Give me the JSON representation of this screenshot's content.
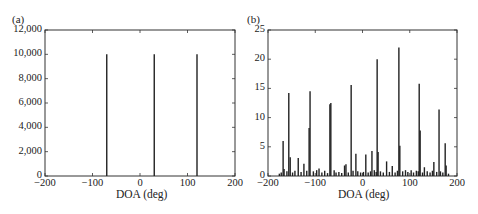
{
  "chart_data": [
    {
      "panel": "(a)",
      "type": "bar",
      "title": "",
      "xlabel": "DOA (deg)",
      "ylabel": "",
      "xlim": [
        -200,
        200
      ],
      "ylim": [
        0,
        12000
      ],
      "xticks": [
        -200,
        -100,
        0,
        100,
        200
      ],
      "xtick_labels": [
        "−200",
        "−100",
        "0",
        "100",
        "200"
      ],
      "yticks": [
        0,
        2000,
        4000,
        6000,
        8000,
        10000,
        12000
      ],
      "ytick_labels": [
        "0",
        "2,000",
        "4,000",
        "6,000",
        "8,000",
        "10,000",
        "12,000"
      ],
      "grid": false,
      "x": [
        -70,
        30,
        120
      ],
      "values": [
        10000,
        10000,
        10000
      ]
    },
    {
      "panel": "(b)",
      "type": "bar",
      "title": "",
      "xlabel": "DOA (deg)",
      "ylabel": "",
      "xlim": [
        -200,
        200
      ],
      "ylim": [
        0,
        25
      ],
      "xticks": [
        -200,
        -100,
        0,
        100,
        200
      ],
      "xtick_labels": [
        "−200",
        "−100",
        "0",
        "100",
        "200"
      ],
      "yticks": [
        0,
        5,
        10,
        15,
        20,
        25
      ],
      "ytick_labels": [
        "0",
        "5",
        "10",
        "15",
        "20",
        "25"
      ],
      "grid": false,
      "x": [
        -176,
        -172,
        -168,
        -166,
        -160,
        -156,
        -153,
        -148,
        -143,
        -136,
        -130,
        -124,
        -118,
        -113,
        -111,
        -104,
        -97,
        -92,
        -86,
        -80,
        -74,
        -69,
        -67,
        -60,
        -56,
        -50,
        -44,
        -38,
        -35,
        -30,
        -24,
        -20,
        -14,
        -10,
        -4,
        2,
        7,
        12,
        17,
        20,
        25,
        29,
        31,
        33,
        38,
        44,
        51,
        57,
        63,
        69,
        74,
        77,
        79,
        85,
        91,
        96,
        103,
        108,
        114,
        118,
        120,
        122,
        127,
        131,
        137,
        143,
        148,
        151,
        157,
        162,
        165,
        170,
        175,
        177,
        182
      ],
      "values": [
        0.4,
        0.6,
        6.0,
        1.2,
        0.8,
        14.2,
        3.2,
        0.6,
        0.9,
        3.1,
        0.7,
        2.1,
        0.9,
        8.2,
        14.5,
        0.8,
        1.0,
        1.3,
        0.6,
        0.9,
        0.5,
        12.3,
        12.5,
        1.0,
        0.6,
        0.7,
        0.5,
        1.8,
        2.0,
        0.6,
        15.6,
        0.9,
        3.8,
        0.8,
        0.6,
        0.7,
        3.7,
        0.6,
        0.8,
        4.3,
        1.0,
        0.7,
        20.0,
        4.1,
        0.8,
        0.6,
        2.5,
        0.7,
        1.7,
        0.6,
        0.9,
        22.0,
        5.2,
        0.8,
        1.0,
        0.7,
        1.0,
        0.6,
        0.9,
        0.8,
        15.8,
        7.8,
        0.6,
        1.5,
        0.8,
        0.6,
        0.9,
        2.4,
        0.7,
        11.4,
        0.8,
        0.6,
        5.6,
        1.8,
        0.4
      ]
    }
  ],
  "panels": {
    "a": {
      "label": "(a)",
      "xlabel": "DOA (deg)"
    },
    "b": {
      "label": "(b)",
      "xlabel": "DOA (deg)"
    }
  }
}
